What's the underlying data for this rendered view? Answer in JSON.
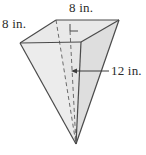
{
  "figure": {
    "name": "triangular-pyramid",
    "labels": {
      "top_edge": "8 in.",
      "left_edge": "8 in.",
      "height": "12 in."
    },
    "annotations": {
      "right_angle_marker": "right-angle-marker",
      "hidden_edges": "dashed",
      "leader_line": "height-leader-line",
      "arrow": "height-arrow"
    },
    "colors": {
      "outline": "#4a4a4a",
      "face_light": "#ededed",
      "face_mid": "#e4e4e4",
      "face_dark": "#dcdcdc",
      "top_face": "#e8e8e8",
      "dashed": "#6e6e6e",
      "text": "#2b2b2b",
      "background": "#ffffff"
    },
    "geometry": {
      "top_left": [
        20,
        43
      ],
      "top_back": [
        56,
        20
      ],
      "top_right": [
        119,
        20
      ],
      "top_front": [
        81,
        42
      ],
      "apex": [
        76,
        144
      ]
    }
  }
}
